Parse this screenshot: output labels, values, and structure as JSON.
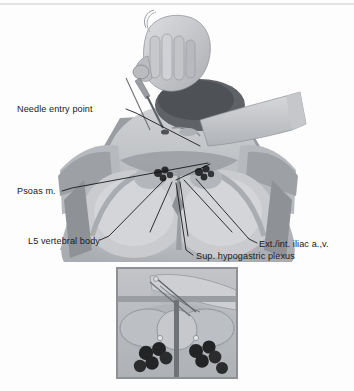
{
  "figure": {
    "type": "medical-illustration",
    "style": "grayscale halftone anatomical drawing",
    "view": "posterior oblique view of prone patient with operator hand",
    "background_color": "#fdfdfd",
    "ink_color": "#1a1a1a"
  },
  "labels": [
    {
      "id": "needle-entry-point",
      "text": "Needle entry point",
      "text_x": 17,
      "text_y": 112,
      "anchor": "start",
      "leader": "M126,109 L136,113 L200,146"
    },
    {
      "id": "psoas-muscle",
      "text": "Psoas m.",
      "text_x": 17,
      "text_y": 194,
      "anchor": "start",
      "leader": "M62,191 L72,188 L208,163"
    },
    {
      "id": "l5-vertebral-body",
      "text": "L5 vertebral body",
      "text_x": 28,
      "text_y": 244,
      "anchor": "start",
      "leader": "M100,240 L109,236 L166,178"
    },
    {
      "id": "ext-int-iliac-vessels",
      "text": "Ext./int. iliac a.,v.",
      "text_x": 259,
      "text_y": 247,
      "anchor": "start",
      "leader": "M257,243 L249,239 L196,179"
    },
    {
      "id": "sup-hypogastric-plexus",
      "text": "Sup. hypogastric plexus",
      "text_x": 196,
      "text_y": 259,
      "anchor": "start",
      "leader": "M193,255 L186,250 L176,183"
    }
  ],
  "extra_leaders": [
    "M210,164 L176,180",
    "M172,182 L150,232",
    "M180,182 L188,236",
    "M184,180 L232,232"
  ],
  "inset": {
    "id": "detail-inset",
    "caption": "",
    "x": 117,
    "y": 268,
    "width": 120,
    "height": 110,
    "border_color": "#8f9095",
    "background_color": "#b9bcc0",
    "description": "close-up axial detail with bilateral vessel clusters and midline needle"
  },
  "palette": {
    "paper": "#fdfdfd",
    "skin_light": "#d8d9dc",
    "skin_mid": "#bfc1c5",
    "skin_dark": "#a2a5aa",
    "shadow": "#7d8085",
    "deep_shadow": "#5a5d62",
    "glove_light": "#d2d3d6",
    "glove_mid": "#b4b6ba",
    "vessel_dark": "#2b2c2e",
    "needle": "#6e7074",
    "rule": "#c9c9cf"
  },
  "vessel_clusters": {
    "main_left": [
      [
        158,
        173
      ],
      [
        165,
        170
      ],
      [
        163,
        177
      ],
      [
        170,
        175
      ]
    ],
    "main_right": [
      [
        199,
        172
      ],
      [
        206,
        169
      ],
      [
        204,
        176
      ],
      [
        211,
        174
      ]
    ],
    "inset_left": [
      [
        146,
        353
      ],
      [
        158,
        348
      ],
      [
        153,
        361
      ],
      [
        166,
        357
      ],
      [
        140,
        365
      ]
    ],
    "inset_right": [
      [
        196,
        351
      ],
      [
        208,
        347
      ],
      [
        203,
        360
      ],
      [
        215,
        356
      ],
      [
        221,
        366
      ]
    ]
  }
}
